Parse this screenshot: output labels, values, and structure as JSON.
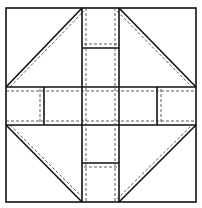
{
  "diagram": {
    "type": "quilt-block-pattern",
    "colors": {
      "background": "#ffffff",
      "line": "#111111",
      "seam": "#333333"
    },
    "outer": {
      "x": 6,
      "y": 8,
      "w": 190,
      "h": 194
    },
    "center_column": {
      "x1": 82,
      "x2": 119
    },
    "center_row": {
      "y1": 87,
      "y2": 125
    },
    "pieces": [
      "corner-triangle-square-top-left",
      "corner-triangle-square-top-right",
      "corner-triangle-square-bottom-left",
      "corner-triangle-square-bottom-right",
      "strip-top",
      "strip-bottom",
      "strip-left",
      "strip-right",
      "center-square"
    ]
  }
}
